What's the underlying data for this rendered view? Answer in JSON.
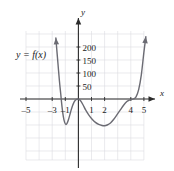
{
  "figure": {
    "name": "polynomial-graph",
    "function_label": "y = f(x)",
    "axis_x_name": "x",
    "axis_y_name": "y",
    "curve_color": "#6b6b73",
    "grid_color": "#d9d9de",
    "axis_color": "#2b2b2b"
  },
  "chart_data": {
    "type": "line",
    "title": "",
    "subtitle": "",
    "xlabel": "x",
    "ylabel": "y",
    "legend": [
      "y = f(x)"
    ],
    "legend_position": "upper-left",
    "grid": true,
    "xlim": [
      -6,
      6
    ],
    "ylim": [
      -200,
      250
    ],
    "xticks": [
      -5,
      -3,
      -1,
      1,
      2,
      4,
      5
    ],
    "xtick_labels": [
      "–5",
      "–3",
      "–1",
      "1",
      "2",
      "4",
      "5"
    ],
    "yticks": [
      50,
      100,
      150,
      200
    ],
    "ytick_labels": [
      "50",
      "100",
      "150",
      "200"
    ],
    "annotations": [
      {
        "text": "y = f(x)",
        "x": -4.3,
        "y": 155
      }
    ],
    "series": [
      {
        "name": "f(x)",
        "arrow_start": true,
        "arrow_end": true,
        "x": [
          -1.72,
          -1.65,
          -1.55,
          -1.45,
          -1.35,
          -1.25,
          -1.15,
          -1.05,
          -0.95,
          -0.85,
          -0.75,
          -0.65,
          -0.55,
          -0.45,
          -0.35,
          -0.25,
          -0.15,
          -0.05,
          0,
          0.15,
          0.35,
          0.55,
          0.8,
          1.05,
          1.3,
          1.55,
          1.8,
          2.0,
          2.2,
          2.45,
          2.7,
          2.95,
          3.2,
          3.45,
          3.7,
          3.9,
          4.05,
          4.2,
          4.4,
          4.6,
          4.8,
          5.0,
          5.15
        ],
        "y": [
          235,
          190,
          130,
          70,
          20,
          -30,
          -68,
          -90,
          -98,
          -92,
          -78,
          -60,
          -42,
          -26,
          -14,
          -6,
          -2,
          0,
          0,
          -6,
          -22,
          -42,
          -62,
          -78,
          -90,
          -98,
          -102,
          -103,
          -100,
          -92,
          -78,
          -60,
          -42,
          -24,
          -10,
          -4,
          -2,
          0,
          8,
          36,
          92,
          180,
          240
        ]
      }
    ]
  }
}
